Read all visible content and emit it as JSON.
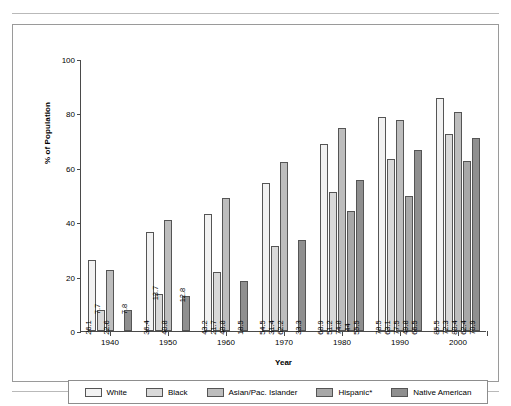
{
  "chart_data": {
    "type": "bar",
    "title": "",
    "xlabel": "Year",
    "ylabel": "% of Population",
    "ylim": [
      0,
      100
    ],
    "yticks": [
      0,
      20,
      40,
      60,
      80,
      100
    ],
    "grid": false,
    "legend_position": "bottom",
    "categories": [
      "1940",
      "1950",
      "1960",
      "1970",
      "1980",
      "1990",
      "2000"
    ],
    "series": [
      {
        "name": "White",
        "color": "#f2f2f2",
        "values": [
          26.1,
          36.4,
          43.2,
          54.5,
          68.9,
          78.5,
          85.5
        ],
        "labels": [
          "26.1",
          "36.4",
          "43.2",
          "54.5",
          "68.9",
          "78.5",
          "85.5"
        ]
      },
      {
        "name": "Black",
        "color": "#d9d9d9",
        "values": [
          7.7,
          13.7,
          21.7,
          31.4,
          51.2,
          63.1,
          72.3
        ],
        "labels": [
          "7.7",
          "13.7",
          "21.7",
          "31.4",
          "51.2",
          "63.1",
          "72.3"
        ]
      },
      {
        "name": "Asian/Pac. Islander",
        "color": "#bdbdbd",
        "values": [
          22.6,
          40.8,
          48.8,
          62.2,
          74.8,
          77.5,
          80.4
        ],
        "labels": [
          "22.6",
          "40.8",
          "48.8",
          "62.2",
          "74.8",
          "77.5",
          "80.4"
        ]
      },
      {
        "name": "Hispanic*",
        "color": "#a8a8a8",
        "values": [
          null,
          null,
          null,
          null,
          44.0,
          49.8,
          62.4
        ],
        "labels": [
          "",
          "",
          "",
          "",
          "44",
          "49.8",
          "62.4"
        ]
      },
      {
        "name": "Native American",
        "color": "#8f8f8f",
        "values": [
          7.8,
          12.8,
          18.5,
          33.3,
          55.5,
          66.5,
          70.9
        ],
        "labels": [
          "7.8",
          "12.8",
          "18.5",
          "33.3",
          "55.5",
          "66.5",
          "70.9"
        ]
      }
    ]
  },
  "legend": {
    "items": [
      {
        "label": "White"
      },
      {
        "label": "Black"
      },
      {
        "label": "Asian/Pac. Islander"
      },
      {
        "label": "Hispanic*"
      },
      {
        "label": "Native American"
      }
    ]
  },
  "axis": {
    "y_label": "% of Population",
    "x_label": "Year",
    "y_ticks": [
      "0",
      "20",
      "40",
      "60",
      "80",
      "100"
    ],
    "x_ticks": [
      "1940",
      "1950",
      "1960",
      "1970",
      "1980",
      "1990",
      "2000"
    ]
  }
}
